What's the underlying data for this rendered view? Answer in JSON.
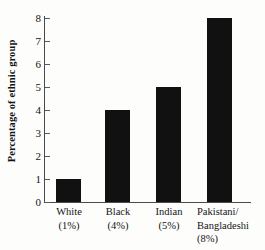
{
  "chart_data": {
    "type": "bar",
    "title": "",
    "subtitle": "",
    "xlabel": "",
    "ylabel": "Percentage of ethnic group",
    "categories": [
      "White",
      "Black",
      "Indian",
      "Pakistani/Bangladeshi"
    ],
    "category_sublabels": [
      "(1%)",
      "(4%)",
      "(5%)",
      "(8%)"
    ],
    "values": [
      1,
      4,
      5,
      8
    ],
    "ylim": [
      0,
      8
    ],
    "ytick_labels": [
      "0",
      "1",
      "2",
      "3",
      "4",
      "5",
      "6",
      "7",
      "8"
    ],
    "ytick_values": [
      0,
      1,
      2,
      3,
      4,
      5,
      6,
      7,
      8
    ],
    "grid": false,
    "legend": null,
    "bar_color": "#111111",
    "axis_color": "#4a4a4a",
    "text_color": "#141414",
    "background_color": "#fdfdfc"
  },
  "x_labels": [
    {
      "lines": [
        "White",
        "(1%)"
      ],
      "align": "centered"
    },
    {
      "lines": [
        "Black",
        "(4%)"
      ],
      "align": "centered"
    },
    {
      "lines": [
        "Indian",
        "(5%)"
      ],
      "align": "centered"
    },
    {
      "lines": [
        "Pakistani/",
        "Bangladeshi",
        "(8%)"
      ],
      "align": "left"
    }
  ]
}
